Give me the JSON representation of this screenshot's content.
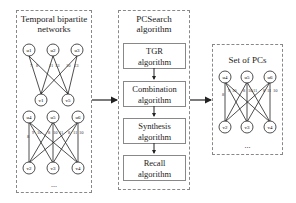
{
  "left_panel": {
    "title_line1": "Temporal bipartite",
    "title_line2": "networks",
    "graph1": {
      "top_nodes": [
        "u1",
        "u2",
        "u3"
      ],
      "bottom_nodes": [
        "v1",
        "v5"
      ],
      "edge_labels": [
        "7",
        "8",
        "11",
        "13",
        "10",
        "13"
      ]
    },
    "graph2": {
      "top_nodes": [
        "u4",
        "u5",
        "u6"
      ],
      "bottom_nodes": [
        "v2",
        "v3",
        "v4"
      ],
      "edge_labels": [
        "8",
        "9",
        "10",
        "8",
        "10",
        "11",
        "8",
        "11",
        "10"
      ]
    },
    "ellipsis": "..."
  },
  "middle_panel": {
    "title_line1": "PCSearch",
    "title_line2": "algorithm",
    "steps": [
      {
        "line1": "TGR",
        "line2": "algorithm"
      },
      {
        "line1": "Combination",
        "line2": "algorithm"
      },
      {
        "line1": "Synthesis",
        "line2": "algorithm"
      },
      {
        "line1": "Recall",
        "line2": "algorithm"
      }
    ]
  },
  "right_panel": {
    "title": "Set of PCs",
    "graph": {
      "top_nodes": [
        "u4",
        "u5",
        "u6"
      ],
      "bottom_nodes": [
        "v2",
        "v3",
        "v4"
      ],
      "edge_labels": [
        "8",
        "9",
        "10",
        "8",
        "10",
        "11",
        "8",
        "11",
        "10"
      ]
    },
    "ellipsis": "..."
  },
  "colors": {
    "line": "#222222",
    "border": "#888888",
    "background": "#ffffff"
  }
}
